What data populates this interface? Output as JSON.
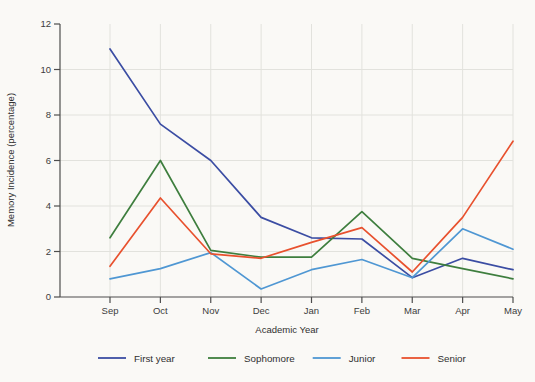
{
  "figure": {
    "background": "#faf9f6",
    "axis_color": "#4d4d4d",
    "grid_color": "#e2e2dd",
    "tick_text_color": "#3c3c3c",
    "label_text_color": "#303030"
  },
  "chart_data": {
    "type": "line",
    "title": "",
    "xlabel": "Academic Year",
    "ylabel": "Memory Incidence (percentage)",
    "categories": [
      "Sep",
      "Oct",
      "Nov",
      "Dec",
      "Jan",
      "Feb",
      "Mar",
      "Apr",
      "May"
    ],
    "ylim": [
      0,
      12
    ],
    "yticks": [
      0,
      2,
      4,
      6,
      8,
      10,
      12
    ],
    "grid": true,
    "legend_position": "bottom",
    "series": [
      {
        "name": "First year",
        "color": "#3b4da3",
        "values": [
          10.9,
          7.6,
          6.0,
          3.5,
          2.6,
          2.55,
          0.85,
          1.7,
          1.2
        ]
      },
      {
        "name": "Sophomore",
        "color": "#3e7e3e",
        "values": [
          2.6,
          6.0,
          2.05,
          1.75,
          1.75,
          3.75,
          1.7,
          1.25,
          0.8
        ]
      },
      {
        "name": "Junior",
        "color": "#4f97d3",
        "values": [
          0.8,
          1.25,
          1.95,
          0.35,
          1.2,
          1.65,
          0.85,
          3.0,
          2.1
        ]
      },
      {
        "name": "Senior",
        "color": "#e8512e",
        "values": [
          1.35,
          4.35,
          1.9,
          1.7,
          2.4,
          3.05,
          1.1,
          3.5,
          6.85
        ]
      }
    ]
  }
}
